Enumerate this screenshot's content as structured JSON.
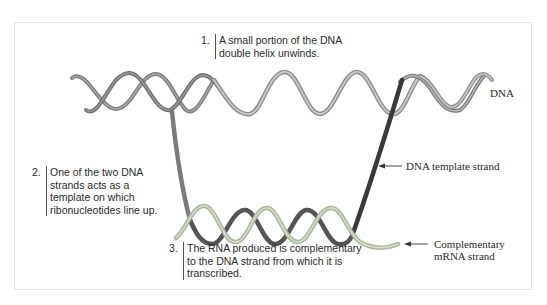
{
  "diagram": {
    "steps": [
      {
        "number": "1.",
        "lines": [
          "A small portion of the DNA",
          "double helix unwinds."
        ]
      },
      {
        "number": "2.",
        "lines": [
          "One of the two DNA",
          "strands acts as a",
          "template on which",
          "ribonucleotides line up."
        ]
      },
      {
        "number": "3.",
        "lines": [
          "The RNA produced is complementary",
          "to the DNA strand from which it is",
          "transcribed."
        ]
      }
    ],
    "labels": {
      "dna": "DNA",
      "template_strand": "DNA template strand",
      "mrna_line1": "Complementary",
      "mrna_line2": "mRNA strand"
    },
    "colors": {
      "strand_gray": "#8a8a8a",
      "strand_light": "#b9b9b9",
      "template_dark": "#3a3a3a",
      "mrna_green": "#a9b79a",
      "frame": "#e6e6e6"
    }
  }
}
